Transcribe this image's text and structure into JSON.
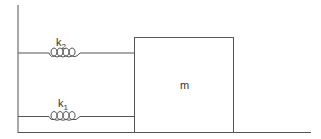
{
  "diagram": {
    "springs": [
      {
        "label": "k",
        "subscript": "2"
      },
      {
        "label": "k",
        "subscript": "1"
      }
    ],
    "mass_label": "m",
    "colors": {
      "line": "#555555",
      "text": "#333333"
    }
  }
}
